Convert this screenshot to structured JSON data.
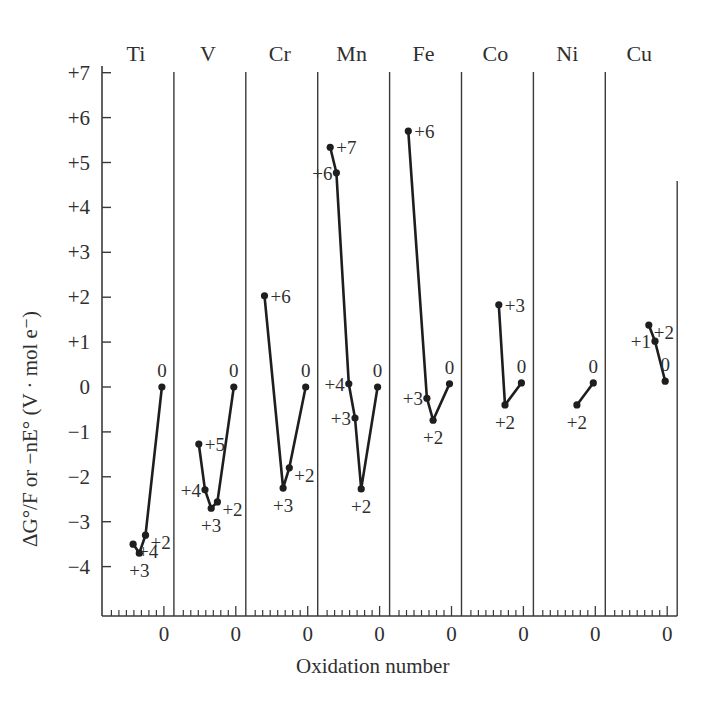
{
  "chart_data": {
    "type": "line",
    "title": "",
    "ylabel": "ΔG°/F or −nE°  (V · mol e⁻)",
    "xlabel": "Oxidation number",
    "ylim": [
      -5,
      7.3
    ],
    "yticks": [
      7,
      6,
      5,
      4,
      3,
      2,
      1,
      0,
      -1,
      -2,
      -3,
      -4
    ],
    "ytick_labels": [
      "+7",
      "+6",
      "+5",
      "+4",
      "+3",
      "+2",
      "+1",
      "0",
      "−1",
      "−2",
      "−3",
      "−4"
    ],
    "grid": false,
    "legend": null,
    "panels": [
      {
        "element": "Ti",
        "x_zero_label": "0",
        "points": [
          {
            "ox": 4,
            "label": "+4",
            "value": -3.5
          },
          {
            "ox": 3,
            "label": "+3",
            "value": -3.7
          },
          {
            "ox": 2,
            "label": "+2",
            "value": -3.3
          },
          {
            "ox": 0,
            "label": "0",
            "value": 0.0
          }
        ]
      },
      {
        "element": "V",
        "x_zero_label": "0",
        "points": [
          {
            "ox": 5,
            "label": "+5",
            "value": -1.27
          },
          {
            "ox": 4,
            "label": "+4",
            "value": -2.29
          },
          {
            "ox": 3,
            "label": "+3",
            "value": -2.7
          },
          {
            "ox": 2,
            "label": "+2",
            "value": -2.56
          },
          {
            "ox": 0,
            "label": "0",
            "value": 0.0
          }
        ]
      },
      {
        "element": "Cr",
        "x_zero_label": "0",
        "points": [
          {
            "ox": 6,
            "label": "+6",
            "value": 2.03
          },
          {
            "ox": 3,
            "label": "+3",
            "value": -2.25
          },
          {
            "ox": 2,
            "label": "+2",
            "value": -1.8
          },
          {
            "ox": 0,
            "label": "0",
            "value": 0.0
          }
        ]
      },
      {
        "element": "Mn",
        "x_zero_label": "0",
        "points": [
          {
            "ox": 7,
            "label": "+7",
            "value": 5.34
          },
          {
            "ox": 6,
            "label": "+6",
            "value": 4.77
          },
          {
            "ox": 4,
            "label": "+4",
            "value": 0.07
          },
          {
            "ox": 3,
            "label": "+3",
            "value": -0.69
          },
          {
            "ox": 2,
            "label": "+2",
            "value": -2.27
          },
          {
            "ox": 0,
            "label": "0",
            "value": 0.0
          }
        ]
      },
      {
        "element": "Fe",
        "x_zero_label": "0",
        "points": [
          {
            "ox": 6,
            "label": "+6",
            "value": 5.7
          },
          {
            "ox": 3,
            "label": "+3",
            "value": -0.25
          },
          {
            "ox": 2,
            "label": "+2",
            "value": -0.74
          },
          {
            "ox": 0,
            "label": "0",
            "value": 0.07
          }
        ]
      },
      {
        "element": "Co",
        "x_zero_label": "0",
        "points": [
          {
            "ox": 3,
            "label": "+3",
            "value": 1.83
          },
          {
            "ox": 2,
            "label": "+2",
            "value": -0.4
          },
          {
            "ox": 0,
            "label": "0",
            "value": 0.09
          }
        ]
      },
      {
        "element": "Ni",
        "x_zero_label": "0",
        "points": [
          {
            "ox": 2,
            "label": "+2",
            "value": -0.4
          },
          {
            "ox": 0,
            "label": "0",
            "value": 0.09
          }
        ]
      },
      {
        "element": "Cu",
        "x_zero_label": "0",
        "points": [
          {
            "ox": 2,
            "label": "+2",
            "value": 1.38
          },
          {
            "ox": 1,
            "label": "+1",
            "value": 1.02
          },
          {
            "ox": 0,
            "label": "0",
            "value": 0.13
          }
        ]
      }
    ]
  },
  "style": {
    "line_color": "#1e1e1e",
    "axis_color": "#3a3a3a",
    "text_color": "#2f2f2f",
    "background": "#ffffff"
  }
}
